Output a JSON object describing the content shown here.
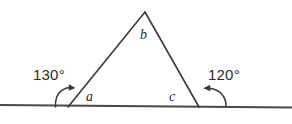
{
  "diagram": {
    "type": "geometry-triangle-exterior-angles",
    "background_color": "#ffffff",
    "line_color": "#3a3a3a",
    "text_color": "#2b2b2b",
    "labels": {
      "exterior_left": "130°",
      "exterior_right": "120°",
      "interior_left": "a",
      "interior_apex": "b",
      "interior_right": "c"
    },
    "geometry": {
      "apex": {
        "x": 145,
        "y": 12
      },
      "base_left": {
        "x": 68,
        "y": 107
      },
      "base_right": {
        "x": 199,
        "y": 107
      },
      "baseline_start": {
        "x": 0,
        "y": 105
      },
      "baseline_end": {
        "x": 292,
        "y": 107.5
      }
    },
    "annotations": {
      "left_arrow_direction": "clockwise-toward-triangle",
      "right_arrow_direction": "counterclockwise-toward-triangle"
    }
  }
}
